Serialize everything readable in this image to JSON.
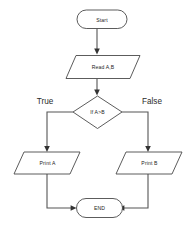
{
  "diagram": {
    "type": "flowchart",
    "background_color": "#ffffff",
    "stroke_color": "#4a4a4a",
    "connector_color": "#555555",
    "text_color": "#1b1b1b",
    "nodes": [
      {
        "id": "start",
        "label": "Start",
        "shape": "terminator"
      },
      {
        "id": "read",
        "label": "Read A,B",
        "shape": "parallelogram"
      },
      {
        "id": "decide",
        "label": "If A>B",
        "shape": "diamond"
      },
      {
        "id": "printa",
        "label": "Print A",
        "shape": "parallelogram"
      },
      {
        "id": "printb",
        "label": "Print B",
        "shape": "parallelogram"
      },
      {
        "id": "end",
        "label": "END",
        "shape": "terminator"
      }
    ],
    "branch_labels": [
      {
        "id": "true-label",
        "label": "True",
        "side": "left"
      },
      {
        "id": "false-label",
        "label": "False",
        "side": "right"
      }
    ],
    "edges": [
      {
        "from": "start",
        "to": "read",
        "label": ""
      },
      {
        "from": "read",
        "to": "decide",
        "label": ""
      },
      {
        "from": "decide",
        "to": "printa",
        "label": "True"
      },
      {
        "from": "decide",
        "to": "printb",
        "label": "False"
      },
      {
        "from": "printa",
        "to": "end",
        "label": ""
      },
      {
        "from": "printb",
        "to": "end",
        "label": ""
      }
    ]
  }
}
